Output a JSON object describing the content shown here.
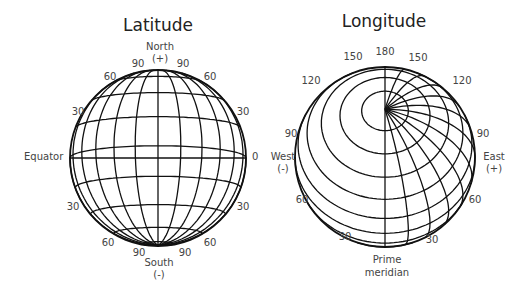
{
  "latitude": {
    "title": "Latitude",
    "north_label": "North",
    "north_sign": "(+)",
    "south_label": "South",
    "south_sign": "(-)",
    "equator_label": "Equator",
    "equator_value": "0",
    "labels_left": [
      "90",
      "60",
      "30",
      "30",
      "60",
      "90"
    ],
    "labels_right": [
      "90",
      "60",
      "30",
      "30",
      "60",
      "90"
    ]
  },
  "longitude": {
    "title": "Longitude",
    "top_value": "180",
    "west_label": "West",
    "west_sign": "(-)",
    "east_label": "East",
    "east_sign": "(+)",
    "prime_label_line1": "Prime",
    "prime_label_line2": "meridian",
    "labels_left": [
      "150",
      "120",
      "90",
      "60",
      "30"
    ],
    "labels_right": [
      "150",
      "120",
      "90",
      "60",
      "30"
    ]
  },
  "colors": {
    "line": "#111111",
    "text": "#444444",
    "background": "#ffffff"
  }
}
